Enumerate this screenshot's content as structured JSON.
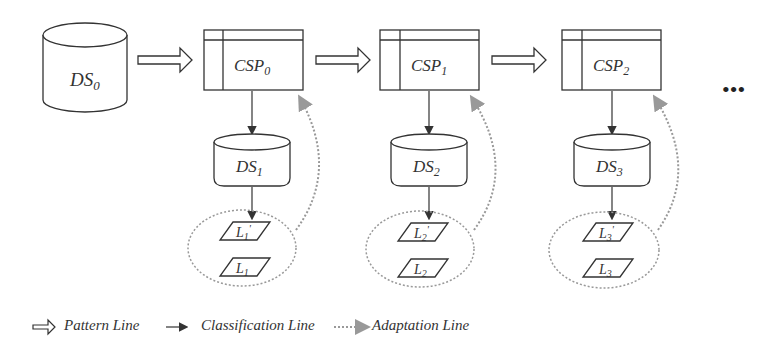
{
  "diagram": {
    "source": {
      "base": "DS",
      "sub": "0"
    },
    "stages": [
      {
        "csp": {
          "base": "CSP",
          "sub": "0"
        },
        "ds": {
          "base": "DS",
          "sub": "1"
        },
        "labels": [
          {
            "base": "L",
            "sub": "1",
            "prime": "'"
          },
          {
            "base": "L",
            "sub": "1",
            "prime": ""
          }
        ]
      },
      {
        "csp": {
          "base": "CSP",
          "sub": "1"
        },
        "ds": {
          "base": "DS",
          "sub": "2"
        },
        "labels": [
          {
            "base": "L",
            "sub": "2",
            "prime": "'"
          },
          {
            "base": "L",
            "sub": "2",
            "prime": ""
          }
        ]
      },
      {
        "csp": {
          "base": "CSP",
          "sub": "2"
        },
        "ds": {
          "base": "DS",
          "sub": "3"
        },
        "labels": [
          {
            "base": "L",
            "sub": "3",
            "prime": "'"
          },
          {
            "base": "L",
            "sub": "3",
            "prime": ""
          }
        ]
      }
    ],
    "ellipsis": "•••"
  },
  "legend": {
    "pattern": "Pattern Line",
    "classification": "Classification Line",
    "adaptation": "Adaptation Line"
  },
  "colors": {
    "stroke": "#333333",
    "dotted": "#888888",
    "background": "#ffffff"
  }
}
